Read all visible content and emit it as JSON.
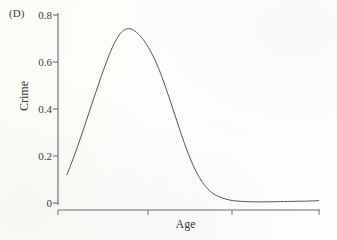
{
  "figure": {
    "panel_label": "(D)",
    "background_color": "#fdfdfb",
    "line_color": "#4a4a4a",
    "axis_color": "#5a5a5a",
    "text_color": "#3a3a3a"
  },
  "chart_data": {
    "type": "line",
    "title": "",
    "subtitle": "",
    "panel": "(D)",
    "xlabel": "Age",
    "ylabel": "Crime",
    "xlim": [
      0,
      100
    ],
    "ylim": [
      0,
      0.8
    ],
    "grid": false,
    "legend": null,
    "x_tick_labels": [
      "",
      "",
      "",
      ""
    ],
    "x_tick_values": [
      0,
      25.5,
      74,
      100
    ],
    "y_tick_labels": [
      "0",
      "0.2",
      "0.4",
      "0.6",
      "0.8"
    ],
    "y_tick_values": [
      0,
      0.2,
      0.4,
      0.6,
      0.8
    ],
    "annotations": [],
    "series": [
      {
        "name": "Crime",
        "x": [
          3.4,
          6.0,
          9.0,
          12.0,
          15.0,
          18.0,
          21.0,
          24.0,
          27.0,
          30.0,
          33.0,
          36.0,
          39.0,
          42.0,
          45.0,
          48.0,
          51.0,
          54.0,
          57.0,
          60.0,
          65.0,
          70.0,
          75.0,
          80.0,
          85.0,
          90.0,
          95.0,
          99.5
        ],
        "y": [
          0.12,
          0.195,
          0.29,
          0.39,
          0.49,
          0.585,
          0.668,
          0.724,
          0.742,
          0.726,
          0.688,
          0.632,
          0.556,
          0.462,
          0.362,
          0.262,
          0.175,
          0.108,
          0.062,
          0.035,
          0.014,
          0.007,
          0.005,
          0.005,
          0.006,
          0.007,
          0.008,
          0.01
        ]
      }
    ]
  },
  "axes_geometry": {
    "plot_left_px": 58,
    "plot_right_px": 320,
    "plot_top_px": 15,
    "plot_bottom_px": 203
  }
}
